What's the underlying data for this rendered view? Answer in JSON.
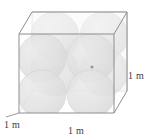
{
  "figure": {
    "shape": "cube",
    "transparent": true,
    "colors": {
      "sphere_fill": "#cfcfcf",
      "sphere_edge": "#bcbcbc",
      "cube_edge_front": "#8c8c8c",
      "cube_edge_back": "#b6b6b6",
      "cube_face_tint": "#f2f2f2",
      "label_color": "#404040",
      "background": "#ffffff",
      "center_dot": "#9a9a9a"
    },
    "spheres": {
      "count": 8,
      "arrangement": "2x2x2",
      "radius_m": 0.25
    },
    "center_marker": {
      "visible": true,
      "x": 92,
      "y": 67
    }
  },
  "labels": {
    "depth": "1 m",
    "width": "1 m",
    "height": "1 m"
  },
  "geometry": {
    "front_top_left": {
      "x": 19,
      "y": 34
    },
    "front_top_right": {
      "x": 114,
      "y": 34
    },
    "front_bottom_left": {
      "x": 19,
      "y": 113
    },
    "front_bottom_right": {
      "x": 114,
      "y": 113
    },
    "back_top_left": {
      "x": 32,
      "y": 12
    },
    "back_top_right": {
      "x": 127,
      "y": 12
    },
    "back_bottom_left": {
      "x": 32,
      "y": 91
    },
    "back_bottom_right": {
      "x": 127,
      "y": 91
    }
  }
}
